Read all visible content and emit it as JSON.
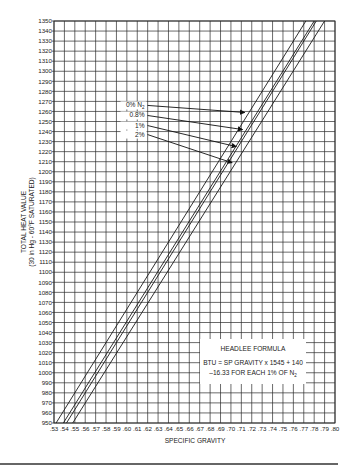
{
  "chart_data": {
    "type": "line",
    "title": "",
    "xlabel": "SPECIFIC GRAVITY",
    "ylabel": "TOTAL HEAT VALUE",
    "ylabel_sub": "(30 in Hg - 60°F SATURATED)",
    "xlim": [
      0.53,
      0.8
    ],
    "ylim": [
      950,
      1350
    ],
    "grid": true,
    "x_ticks": [
      ".53",
      ".54",
      ".55",
      ".56",
      ".57",
      ".58",
      ".59",
      ".60",
      ".61",
      ".62",
      ".63",
      ".64",
      ".65",
      ".66",
      ".67",
      ".68",
      ".69",
      ".70",
      ".71",
      ".72",
      ".73",
      ".74",
      ".75",
      ".76",
      ".77",
      ".78",
      ".79",
      ".80"
    ],
    "y_ticks": [
      950,
      960,
      970,
      980,
      990,
      1000,
      1010,
      1020,
      1030,
      1040,
      1050,
      1060,
      1070,
      1080,
      1090,
      1100,
      1110,
      1120,
      1130,
      1140,
      1150,
      1160,
      1170,
      1180,
      1190,
      1200,
      1210,
      1220,
      1230,
      1240,
      1250,
      1260,
      1270,
      1280,
      1290,
      1300,
      1310,
      1320,
      1330,
      1340,
      1350
    ],
    "series": [
      {
        "name": "upper bound",
        "points": [
          [
            0.532,
            950
          ],
          [
            0.772,
            1350
          ]
        ]
      },
      {
        "name": "0% N2",
        "points": [
          [
            0.539,
            950
          ],
          [
            0.78,
            1350
          ]
        ]
      },
      {
        "name": "0.8% N2",
        "points": [
          [
            0.542,
            950
          ],
          [
            0.782,
            1350
          ]
        ]
      },
      {
        "name": "lower bound",
        "points": [
          [
            0.548,
            950
          ],
          [
            0.79,
            1350
          ]
        ]
      }
    ],
    "annotations": [
      {
        "text": "0% N",
        "sub": "2",
        "label_xy": [
          0.617,
          1264
        ],
        "arrow_to": [
          0.713,
          1259
        ]
      },
      {
        "text": "0.8%",
        "sub": "",
        "label_xy": [
          0.617,
          1254
        ],
        "arrow_to": [
          0.711,
          1242
        ]
      },
      {
        "text": "1%",
        "sub": "",
        "label_xy": [
          0.617,
          1244
        ],
        "arrow_to": [
          0.705,
          1225
        ]
      },
      {
        "text": "2%",
        "sub": "",
        "label_xy": [
          0.617,
          1235
        ],
        "arrow_to": [
          0.701,
          1209
        ]
      }
    ],
    "legend_box": {
      "title": "HEADLEE FORMULA",
      "line1": "BTU = SP GRAVITY x 1545 + 140",
      "line2": "–16.33 FOR EACH 1% OF N",
      "line2_sub": "2"
    }
  },
  "colors": {
    "grid": "#2b2b2b",
    "line": "#1a1a1a",
    "text": "#222222",
    "background": "#ffffff"
  }
}
